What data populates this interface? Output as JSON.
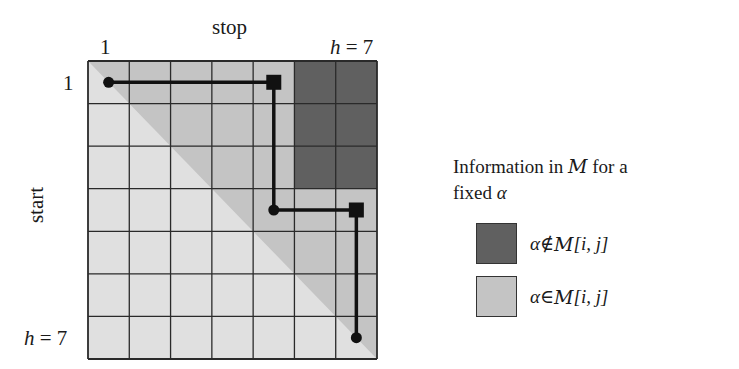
{
  "axes": {
    "top_label": "stop",
    "left_label": "start",
    "top_tick_start": "1",
    "top_tick_end_var": "h",
    "top_tick_end_eq": " = 7",
    "left_tick_start": "1",
    "left_tick_end_var": "h",
    "left_tick_end_eq": " = 7"
  },
  "grid": {
    "size": 7,
    "colors": {
      "light": "#e0e0e0",
      "mid": "#c4c4c4",
      "dark": "#606060",
      "line": "#2a2a2a",
      "path": "#111111"
    },
    "dark_block": {
      "rows": [
        1,
        2,
        3
      ],
      "cols": [
        6,
        7
      ]
    },
    "path_points": [
      {
        "row": 1,
        "col": 1,
        "marker": "circle"
      },
      {
        "row": 1,
        "col": 5,
        "marker": "square"
      },
      {
        "row": 4,
        "col": 5,
        "marker": "circle"
      },
      {
        "row": 4,
        "col": 7,
        "marker": "square"
      },
      {
        "row": 7,
        "col": 7,
        "marker": "circle"
      }
    ]
  },
  "legend": {
    "title_part1": "Information in ",
    "title_symbol": "M",
    "title_part2": " for a",
    "title_line2": "fixed ",
    "title_alpha": "α",
    "items": [
      {
        "color": "#606060",
        "alpha": "α",
        "relation": " ∉ ",
        "symbol": "M",
        "args": "[i, j]"
      },
      {
        "color": "#c4c4c4",
        "alpha": "α",
        "relation": " ∈ ",
        "symbol": "M",
        "args": "[i, j]"
      }
    ]
  }
}
